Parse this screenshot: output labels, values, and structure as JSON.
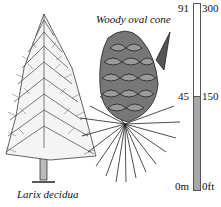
{
  "tree": {
    "caption": "Larix decidua"
  },
  "cone": {
    "caption": "Woody oval cone"
  },
  "scale": {
    "metric": {
      "top": "91",
      "mid": "45",
      "bottom": "0m"
    },
    "imperial": {
      "top": "300",
      "mid": "150",
      "bottom": "0ft"
    },
    "fill_fraction": 0.5,
    "fill_color": "#a8a8a8"
  }
}
